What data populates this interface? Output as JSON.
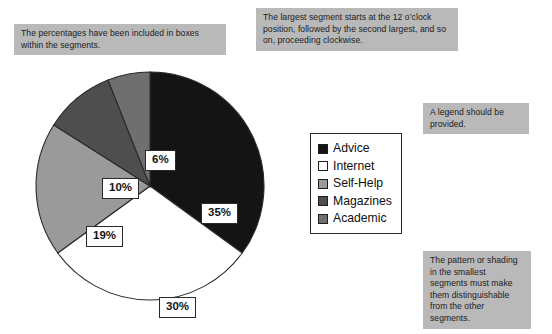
{
  "figure": {
    "background_color": "#ffffff",
    "callout_color": "#b9b9b9"
  },
  "callouts": [
    {
      "id": "percentages",
      "text": "The percentages have been included in boxes within the segments."
    },
    {
      "id": "order",
      "text": "The largest segment starts at the 12 o’clock position, followed by the second largest, and so on, proceeding clockwise."
    },
    {
      "id": "legend",
      "text": "A legend should be provided."
    },
    {
      "id": "shading",
      "text": "The pattern or shading in the smallest segments must make them distinguishable from the other segments."
    }
  ],
  "legend": {
    "position": "right",
    "items": [
      {
        "label": "Advice",
        "color": "#141414"
      },
      {
        "label": "Internet",
        "color": "#ffffff"
      },
      {
        "label": "Self-Help",
        "color": "#9a9a9a"
      },
      {
        "label": "Magazines",
        "color": "#4e4e4e"
      },
      {
        "label": "Academic",
        "color": "#6f6f6f"
      }
    ]
  },
  "chart_data": {
    "type": "pie",
    "title": "",
    "xlabel": "",
    "ylabel": "",
    "start_angle_clock": "12 o'clock",
    "direction": "clockwise",
    "grid": false,
    "legend_position": "right",
    "categories": [
      "Advice",
      "Internet",
      "Self-Help",
      "Magazines",
      "Academic"
    ],
    "values": [
      35,
      30,
      19,
      10,
      6
    ],
    "value_labels": [
      "35%",
      "30%",
      "19%",
      "10%",
      "6%"
    ],
    "colors": [
      "#141414",
      "#ffffff",
      "#9a9a9a",
      "#4e4e4e",
      "#6f6f6f"
    ],
    "slice_outline_color": "#2a2a2a",
    "units": "percent",
    "total": 100
  }
}
